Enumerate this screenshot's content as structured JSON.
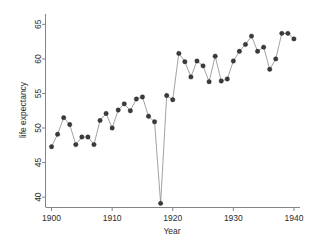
{
  "chart_data": {
    "type": "line",
    "title": "",
    "subtitle": "",
    "xlabel": "Year",
    "ylabel": "life expectancy",
    "xlim": [
      1899,
      1941
    ],
    "ylim": [
      38.5,
      66.5
    ],
    "xticks": [
      1900,
      1910,
      1920,
      1930,
      1940
    ],
    "yticks": [
      40,
      45,
      50,
      55,
      60,
      65
    ],
    "xtick_labels": [
      "1900",
      "1910",
      "1920",
      "1930",
      "1940"
    ],
    "ytick_labels": [
      "40",
      "45",
      "50",
      "55",
      "60",
      "65"
    ],
    "grid": false,
    "legend": false,
    "legend_position": "none",
    "marker": "filled-circle",
    "marker_color": "#3b3b3b",
    "line_color": "#8a8a8a",
    "x": [
      1900,
      1901,
      1902,
      1903,
      1904,
      1905,
      1906,
      1907,
      1908,
      1909,
      1910,
      1911,
      1912,
      1913,
      1914,
      1915,
      1916,
      1917,
      1918,
      1919,
      1920,
      1921,
      1922,
      1923,
      1924,
      1925,
      1926,
      1927,
      1928,
      1929,
      1930,
      1931,
      1932,
      1933,
      1934,
      1935,
      1936,
      1937,
      1938,
      1939,
      1940
    ],
    "series": [
      {
        "name": "life expectancy",
        "values": [
          47.3,
          49.1,
          51.5,
          50.5,
          47.6,
          48.7,
          48.7,
          47.6,
          51.1,
          52.1,
          50.0,
          52.6,
          53.5,
          52.5,
          54.2,
          54.5,
          51.7,
          50.9,
          39.1,
          54.7,
          54.1,
          60.8,
          59.6,
          57.4,
          59.7,
          59.0,
          56.7,
          60.4,
          56.8,
          57.1,
          59.7,
          61.1,
          62.1,
          63.3,
          61.1,
          61.7,
          58.5,
          60.0,
          63.7,
          63.7,
          62.9
        ]
      }
    ]
  }
}
